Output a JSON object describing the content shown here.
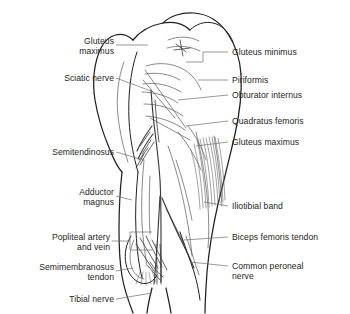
{
  "figure": {
    "view": "posterior",
    "background_color": "#ffffff",
    "outline_color": "#231f20",
    "detail_color": "#58585b",
    "leader_color": "#6d6e71",
    "text_color": "#231f20"
  },
  "labels_left": [
    {
      "id": "gluteus-maximus-left",
      "text": "Gluteus\nmaximus"
    },
    {
      "id": "sciatic-nerve",
      "text": "Sciatic nerve"
    },
    {
      "id": "semitendinosus",
      "text": "Semitendinosus"
    },
    {
      "id": "adductor-magnus",
      "text": "Adductor\nmagnus"
    },
    {
      "id": "popliteal-artery-and-vein",
      "text": "Popliteal artery\nand vein"
    },
    {
      "id": "semimembranosus-tendon",
      "text": "Semimembranosus\ntendon"
    },
    {
      "id": "tibial-nerve",
      "text": "Tibial nerve"
    }
  ],
  "labels_right": [
    {
      "id": "gluteus-minimus",
      "text": "Gluteus minimus"
    },
    {
      "id": "piriformis",
      "text": "Piriformis"
    },
    {
      "id": "obturator-internus",
      "text": "Obturator internus"
    },
    {
      "id": "quadratus-femoris",
      "text": "Quadratus femoris"
    },
    {
      "id": "gluteus-maximus-right",
      "text": "Gluteus maximus"
    },
    {
      "id": "iliotibial-band",
      "text": "Iliotibial band"
    },
    {
      "id": "biceps-femoris-tendon",
      "text": "Biceps femoris tendon"
    },
    {
      "id": "common-peroneal-nerve",
      "text": "Common peroneal\nnerve"
    }
  ]
}
